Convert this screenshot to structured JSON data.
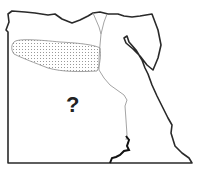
{
  "map": {
    "subject": "Egypt outline map",
    "label": "?",
    "highlighted_region": "dotted area in northwest (Western Desert / Qattara region)",
    "colors": {
      "border": "#2a2a2a",
      "river": "#9a9a9a",
      "dots": "#777777",
      "background": "#ffffff"
    }
  }
}
